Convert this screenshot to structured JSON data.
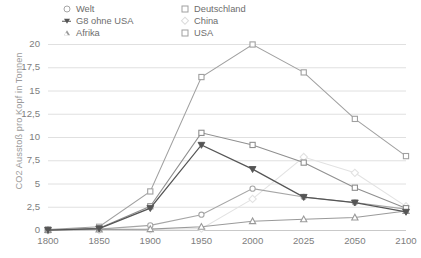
{
  "chart_data": {
    "type": "line",
    "title": "",
    "xlabel": "",
    "ylabel": "CO2 Ausstoß pro Kopf in Tonnen",
    "categories": [
      "1800",
      "1850",
      "1900",
      "1950",
      "2000",
      "2025",
      "2050",
      "2100"
    ],
    "ylim": [
      0,
      20
    ],
    "yticks": [
      "0",
      "2,5",
      "5",
      "7,5",
      "10",
      "12,5",
      "15",
      "17,5",
      "20"
    ],
    "ytick_values": [
      0,
      2.5,
      5,
      7.5,
      10,
      12.5,
      15,
      17.5,
      20
    ],
    "grid": true,
    "legend_position": "top",
    "series": [
      {
        "name": "Welt",
        "marker": "circle",
        "color": "#a6a6a6",
        "values": [
          0.05,
          0.15,
          0.55,
          1.7,
          4.5,
          3.6,
          3.0,
          2.3
        ]
      },
      {
        "name": "G8 ohne USA",
        "marker": "down-triangle",
        "color": "#555555",
        "values": [
          0.05,
          0.2,
          2.4,
          9.2,
          6.6,
          3.6,
          3.0,
          2.0
        ]
      },
      {
        "name": "Afrika",
        "marker": "triangle",
        "color": "#9a9a9a",
        "values": [
          0.05,
          0.1,
          0.15,
          0.4,
          1.0,
          1.2,
          1.4,
          2.1
        ]
      },
      {
        "name": "Deutschland",
        "marker": "square",
        "color": "#8f8f8f",
        "values": [
          0.05,
          0.25,
          2.6,
          10.5,
          9.2,
          7.3,
          4.6,
          2.4
        ]
      },
      {
        "name": "China",
        "marker": "diamond",
        "color": "#e2e2e2",
        "values": [
          0.02,
          0.05,
          0.1,
          0.2,
          3.4,
          7.9,
          6.2,
          2.6
        ]
      },
      {
        "name": "USA",
        "marker": "square",
        "color": "#a0a0a0",
        "values": [
          0.1,
          0.4,
          4.2,
          16.5,
          20.0,
          17.0,
          12.0,
          8.0
        ]
      }
    ]
  },
  "legend": {
    "items": [
      {
        "label": "Welt",
        "marker": "circle"
      },
      {
        "label": "Deutschland",
        "marker": "square"
      },
      {
        "label": "G8 ohne USA",
        "marker": "down-triangle"
      },
      {
        "label": "China",
        "marker": "diamond"
      },
      {
        "label": "Afrika",
        "marker": "triangle"
      },
      {
        "label": "USA",
        "marker": "square"
      }
    ]
  }
}
